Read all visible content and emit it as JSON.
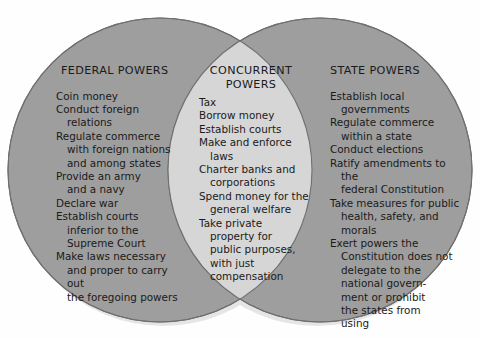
{
  "diagram": {
    "type": "venn",
    "kind": "two-set-venn-diagram",
    "background_color": "#fefefe",
    "circle_fill": "#9e9e9e",
    "overlap_fill": "#d6d6d6",
    "circle_stroke": "#6f6f6f",
    "text_color": "#1a1a1a"
  },
  "federal": {
    "heading": "FEDERAL POWERS",
    "items": [
      "Coin money",
      "Conduct foreign\nrelations",
      "Regulate commerce\nwith foreign nations\nand among states",
      "Provide an army\nand a navy",
      "Declare war",
      "Establish courts\ninferior to the\nSupreme Court",
      "Make laws necessary\nand proper to carry out\nthe foregoing powers"
    ]
  },
  "concurrent": {
    "heading": "CONCURRENT\nPOWERS",
    "items": [
      "Tax",
      "Borrow money",
      "Establish courts",
      "Make and enforce\nlaws",
      "Charter banks and\ncorporations",
      "Spend money for the\ngeneral welfare",
      "Take private\nproperty for\npublic purposes,\nwith just\ncompensation"
    ]
  },
  "state": {
    "heading": "STATE POWERS",
    "items": [
      "Establish local\ngovernments",
      "Regulate commerce\nwithin a state",
      "Conduct elections",
      "Ratify amendments to the\nfederal Constitution",
      "Take measures for public\nhealth, safety, and\nmorals",
      "Exert powers the\nConstitution does not\ndelegate to the\nnational govern-\nment or prohibit\nthe states from\nusing"
    ]
  }
}
